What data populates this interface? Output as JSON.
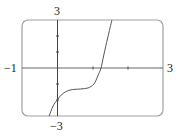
{
  "chart_data": {
    "type": "line",
    "title": "",
    "xlabel": "",
    "ylabel": "",
    "xlim": [
      -1,
      3
    ],
    "ylim": [
      -3,
      3
    ],
    "grid": false,
    "legend": null,
    "x_ticks": [
      1,
      2
    ],
    "y_ticks": [
      -2,
      -1,
      1,
      2
    ],
    "tick_labels": {
      "x_min": "−1",
      "x_max": "3",
      "y_max": "3",
      "y_min": "−3"
    },
    "series": [
      {
        "name": "f(x)",
        "x": [
          -0.23,
          -0.12,
          0.0,
          0.14,
          0.36,
          0.65,
          0.87,
          1.04,
          1.15,
          1.24,
          1.32,
          1.43,
          1.55
        ],
        "y": [
          -3.0,
          -2.38,
          -2.0,
          -1.63,
          -1.38,
          -1.31,
          -1.25,
          -1.0,
          -0.5,
          0.0,
          0.81,
          1.88,
          3.0
        ]
      }
    ],
    "colors": {
      "axis": "#555555",
      "frame": "#9a9a9a",
      "curve": "#555555"
    }
  }
}
